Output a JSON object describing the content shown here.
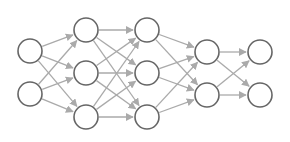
{
  "diagram": {
    "type": "neural-network",
    "width": 290,
    "height": 142,
    "node_radius": 12,
    "colors": {
      "node_stroke": "#666666",
      "node_fill": "#ffffff",
      "edge": "#aaaaaa",
      "background": "#ffffff"
    },
    "layers": [
      {
        "name": "input-layer",
        "x": 30,
        "nodes_y": [
          51,
          94
        ]
      },
      {
        "name": "hidden-layer-1",
        "x": 86,
        "nodes_y": [
          30,
          73,
          117
        ]
      },
      {
        "name": "hidden-layer-2",
        "x": 147,
        "nodes_y": [
          30,
          73,
          117
        ]
      },
      {
        "name": "hidden-layer-3",
        "x": 207,
        "nodes_y": [
          52,
          95
        ]
      },
      {
        "name": "output-layer",
        "x": 260,
        "nodes_y": [
          52,
          95
        ]
      }
    ],
    "connectivity": "fully-connected-between-adjacent-layers"
  }
}
